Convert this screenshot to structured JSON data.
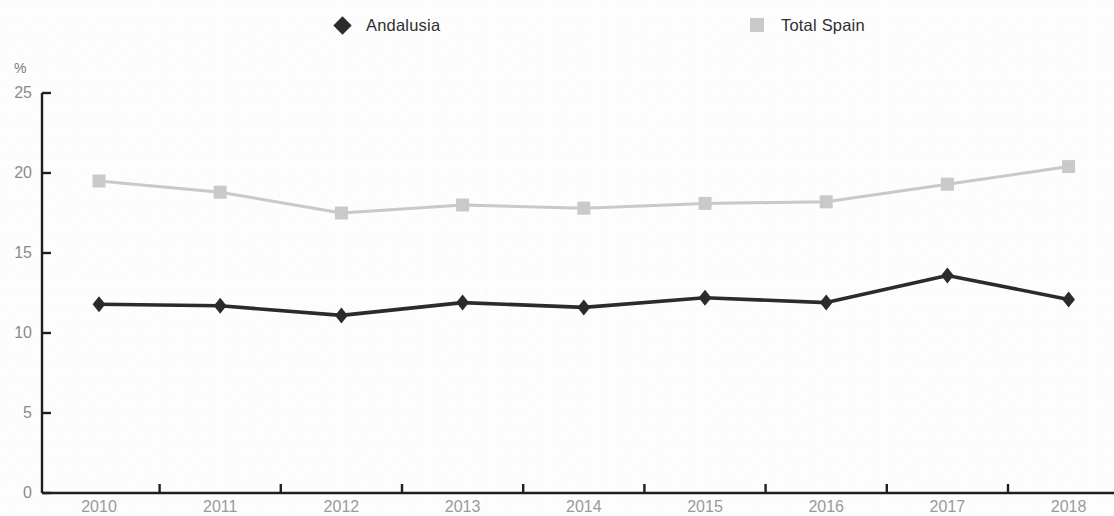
{
  "legend": {
    "position": "top",
    "entries": [
      {
        "label": "Andalusia",
        "marker": "diamond-icon",
        "color": "#2b2b2b"
      },
      {
        "label": "Total Spain",
        "marker": "square-icon",
        "color": "#c9c9c9"
      }
    ]
  },
  "axis": {
    "y_unit_label": "%",
    "y_ticks": [
      "0",
      "5",
      "10",
      "15",
      "20",
      "25"
    ],
    "x_ticks": [
      "2010",
      "2011",
      "2012",
      "2013",
      "2014",
      "2015",
      "2016",
      "2017",
      "2018"
    ]
  },
  "chart_data": {
    "type": "line",
    "title": "",
    "subtitle": "",
    "xlabel": "",
    "ylabel": "%",
    "x": [
      "2010",
      "2011",
      "2012",
      "2013",
      "2014",
      "2015",
      "2016",
      "2017",
      "2018"
    ],
    "categories": [
      "2010",
      "2011",
      "2012",
      "2013",
      "2014",
      "2015",
      "2016",
      "2017",
      "2018"
    ],
    "series": [
      {
        "name": "Andalusia",
        "color": "#2b2b2b",
        "marker": "diamond",
        "values": [
          11.8,
          11.7,
          11.1,
          11.9,
          11.6,
          12.2,
          11.9,
          13.6,
          12.1
        ]
      },
      {
        "name": "Total Spain",
        "color": "#c9c9c9",
        "marker": "square",
        "values": [
          19.5,
          18.8,
          17.5,
          18.0,
          17.8,
          18.1,
          18.2,
          19.3,
          20.4
        ]
      }
    ],
    "ylim": [
      0,
      25
    ],
    "ytick_values": [
      0,
      5,
      10,
      15,
      20,
      25
    ],
    "grid": false,
    "legend_position": "top"
  }
}
